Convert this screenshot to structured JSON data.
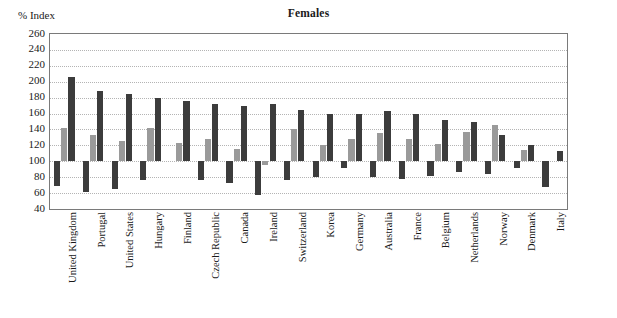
{
  "chart_data": {
    "type": "bar",
    "title": "Females",
    "xlabel": "",
    "ylabel": "% Index",
    "ylim": [
      40,
      260
    ],
    "ytick_step": 20,
    "yticks": [
      260,
      240,
      220,
      200,
      180,
      160,
      140,
      120,
      100,
      80,
      60,
      40
    ],
    "baseline": 100,
    "grid": true,
    "legend_position": "none",
    "colors": {
      "dark": "#3c3c3c",
      "gray": "#9a9a9a",
      "gridline": "#b4b4b4",
      "axis": "#7a7a7a",
      "text": "#1a1a1a",
      "background": "#ffffff"
    },
    "categories": [
      "United Kingdom",
      "Portugal",
      "United States",
      "Hungary",
      "Finland",
      "Czech Republic",
      "Canada",
      "Ireland",
      "Switzerland",
      "Korea",
      "Germany",
      "Australia",
      "France",
      "Belgium",
      "Netherlands",
      "Norway",
      "Denmark",
      "Italy"
    ],
    "series": [
      {
        "name": "lower",
        "color": "#3c3c3c",
        "values": [
          69,
          61,
          65,
          77,
          100,
          76,
          73,
          57,
          77,
          80,
          91,
          80,
          78,
          81,
          87,
          84,
          92,
          68
        ]
      },
      {
        "name": "middle",
        "color": "#9a9a9a",
        "values": [
          142,
          133,
          126,
          142,
          123,
          128,
          115,
          95,
          140,
          121,
          128,
          136,
          128,
          122,
          137,
          145,
          114,
          100
        ]
      },
      {
        "name": "upper",
        "color": "#3c3c3c",
        "values": [
          206,
          188,
          184,
          179,
          176,
          172,
          170,
          172,
          164,
          160,
          160,
          163,
          160,
          152,
          150,
          133,
          121,
          113
        ]
      }
    ]
  }
}
